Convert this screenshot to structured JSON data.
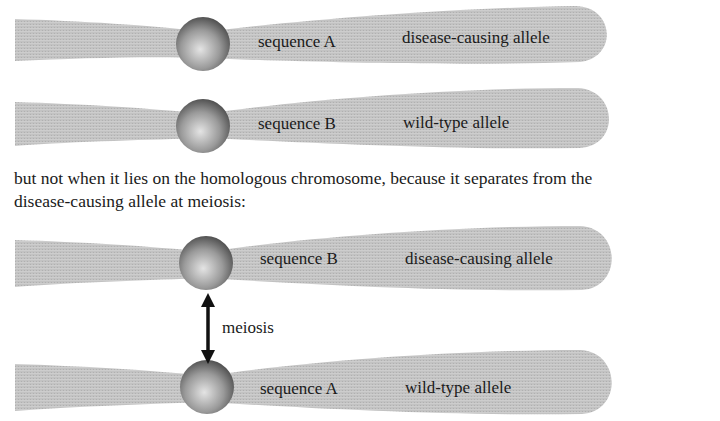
{
  "figure": {
    "chromosome_pair_1": {
      "top": {
        "sequence": "sequence A",
        "allele": "disease-causing allele"
      },
      "bottom": {
        "sequence": "sequence B",
        "allele": "wild-type allele"
      }
    },
    "caption": {
      "line1": "but not when it lies on the homologous chromosome, because it separates from the",
      "line2": "disease-causing allele at meiosis:"
    },
    "chromosome_pair_2": {
      "top": {
        "sequence": "sequence B",
        "allele": "disease-causing allele"
      },
      "bottom": {
        "sequence": "sequence A",
        "allele": "wild-type allele"
      },
      "arrow_label": "meiosis"
    },
    "colors": {
      "chromosome": "#c4c4c4",
      "centromere_dark": "#4a4a4a",
      "centromere_light": "#e0e0e0",
      "arrow": "#111111"
    }
  }
}
